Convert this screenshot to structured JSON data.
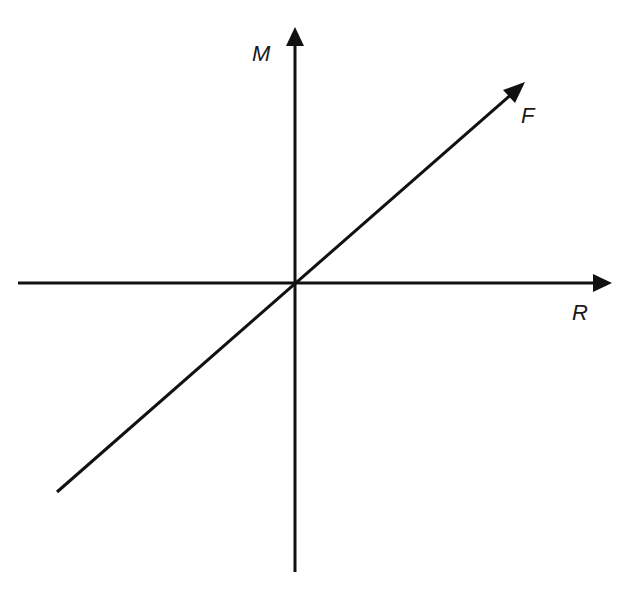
{
  "diagram": {
    "axes": {
      "vertical_label": "M",
      "horizontal_label": "R"
    },
    "line": {
      "label": "F"
    },
    "colors": {
      "stroke": "#111111",
      "background": "#ffffff"
    }
  }
}
